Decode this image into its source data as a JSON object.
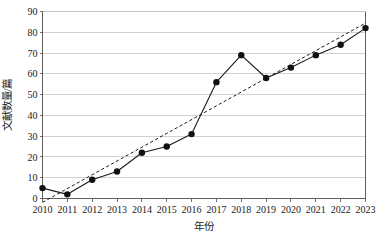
{
  "chart_data": {
    "type": "line",
    "title": "",
    "xlabel": "年份",
    "ylabel": "文献数量/篇",
    "x": [
      2010,
      2011,
      2012,
      2013,
      2014,
      2015,
      2016,
      2017,
      2018,
      2019,
      2020,
      2021,
      2022,
      2023
    ],
    "categories": [
      "2010",
      "2011",
      "2012",
      "2013",
      "2014",
      "2015",
      "2016",
      "2017",
      "2018",
      "2019",
      "2020",
      "2021",
      "2022",
      "2023"
    ],
    "values": [
      5,
      2,
      9,
      13,
      22,
      25,
      31,
      56,
      69,
      58,
      63,
      69,
      74,
      82
    ],
    "series": [
      {
        "name": "文献数量",
        "style": "solid-with-markers",
        "values": [
          5,
          2,
          9,
          13,
          22,
          25,
          31,
          56,
          69,
          58,
          63,
          69,
          74,
          82
        ]
      },
      {
        "name": "趋势线",
        "style": "dashed-trend",
        "values": [
          0.5,
          6.8,
          13.1,
          19.4,
          25.7,
          32.0,
          38.3,
          44.6,
          50.9,
          57.2,
          63.5,
          69.8,
          76.1,
          82.4
        ]
      }
    ],
    "ylim": [
      0,
      90
    ],
    "yticks": [
      0,
      10,
      20,
      30,
      40,
      50,
      60,
      70,
      80,
      90
    ],
    "ytick_labels": [
      "0",
      "10",
      "20",
      "30",
      "40",
      "50",
      "60",
      "70",
      "80",
      "90"
    ],
    "xtick_labels": [
      "2010",
      "2011",
      "2012",
      "2013",
      "2014",
      "2015",
      "2016",
      "2017",
      "2018",
      "2019",
      "2020",
      "2021",
      "2022",
      "2023"
    ],
    "grid": "horizontal",
    "legend": "none",
    "colors": {
      "line": "#1a1a1a",
      "marker": "#111111",
      "grid": "#bfbfbf",
      "axis": "#4d4d4d",
      "background": "#ffffff"
    }
  }
}
